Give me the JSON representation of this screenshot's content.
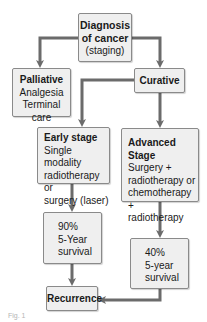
{
  "diagram": {
    "type": "flowchart",
    "colors": {
      "box_fill": "#efefef",
      "box_border": "#8a8a8a",
      "arrow": "#6b6b6b",
      "text": "#1a1a1a"
    },
    "nodes": {
      "diagnosis": {
        "title": "Diagnosis",
        "lines": [
          "of cancer",
          "(staging)"
        ]
      },
      "palliative": {
        "title": "Palliative",
        "lines": [
          "Analgesia",
          "Terminal care"
        ]
      },
      "curative": {
        "title": "Curative"
      },
      "early_stage": {
        "title": "Early stage",
        "lines": [
          "Single modality",
          "radiotherapy or",
          "surgery (laser)"
        ]
      },
      "advanced_stage": {
        "title": "Advanced Stage",
        "lines": [
          "Surgery +",
          "radiotherapy or",
          "chemotherapy +",
          "radiotherapy"
        ]
      },
      "survival_early": {
        "lines": [
          "90%",
          "5-Year",
          "survival"
        ]
      },
      "survival_advanced": {
        "lines": [
          "40%",
          "5-year",
          "survival"
        ]
      },
      "recurrence": {
        "title": "Recurrence"
      }
    },
    "edges": [
      {
        "from": "diagnosis",
        "to": "palliative"
      },
      {
        "from": "diagnosis",
        "to": "curative"
      },
      {
        "from": "curative",
        "to": "early_stage"
      },
      {
        "from": "curative",
        "to": "advanced_stage"
      },
      {
        "from": "early_stage",
        "to": "survival_early"
      },
      {
        "from": "advanced_stage",
        "to": "survival_advanced"
      },
      {
        "from": "survival_early",
        "to": "recurrence"
      },
      {
        "from": "survival_advanced",
        "to": "recurrence"
      }
    ],
    "caption": "Fig. 1"
  }
}
